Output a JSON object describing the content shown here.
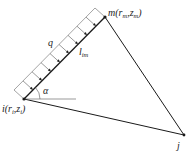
{
  "diagram": {
    "type": "triangular finite element with distributed edge load",
    "nodes": {
      "i": {
        "label": "i(r",
        "sub1": "i",
        "mid": ",z",
        "sub2": "i",
        "close": ")",
        "x": 24,
        "y": 99
      },
      "m": {
        "label": "m(r",
        "sub1": "m",
        "mid": ",z",
        "sub2": "m",
        "close": ")",
        "x": 105,
        "y": 17
      },
      "j": {
        "label": "j",
        "x": 184,
        "y": 135
      }
    },
    "load": {
      "label": "q",
      "arrow_count": 8
    },
    "edge_length": {
      "label": "l",
      "sub": "im"
    },
    "angle": {
      "label": "α"
    },
    "colors": {
      "line": "#1a1a1a",
      "text": "#222222",
      "hatch": "#555555"
    }
  }
}
